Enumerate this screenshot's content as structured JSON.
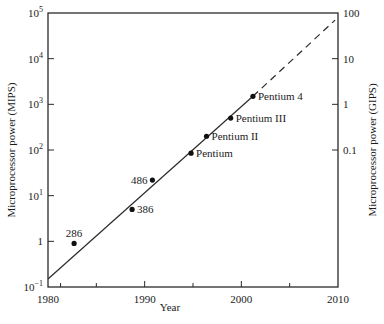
{
  "chart_data": {
    "type": "scatter",
    "title": "",
    "xlabel": "Year",
    "ylabel": "Microprocessor power (MIPS)",
    "ylabel_right": "Microprocessor power (GIPS)",
    "xlim": [
      1980,
      2010
    ],
    "ylim": [
      0.1,
      100000
    ],
    "yscale": "log",
    "grid": false,
    "legend": null,
    "x_ticks": [
      1980,
      1990,
      2000,
      2010
    ],
    "x_tick_labels": [
      "1980",
      "1990",
      "2000",
      "2010"
    ],
    "x_minor_ticks": [
      1981.3,
      1985,
      1995,
      2005
    ],
    "y_ticks": [
      0.1,
      1,
      10,
      100,
      1000,
      10000,
      100000
    ],
    "y_tick_labels": [
      {
        "base": "10",
        "exp": "−1"
      },
      {
        "base": "1",
        "exp": ""
      },
      {
        "base": "10",
        "exp": "1"
      },
      {
        "base": "10",
        "exp": "2"
      },
      {
        "base": "10",
        "exp": "3"
      },
      {
        "base": "10",
        "exp": "4"
      },
      {
        "base": "10",
        "exp": "5"
      }
    ],
    "y_right_ticks_mips": [
      100,
      1000,
      10000,
      100000
    ],
    "y_right_tick_labels": [
      "0.1",
      "1",
      "10",
      "100"
    ],
    "points": [
      {
        "label": "286",
        "x": 1982.7,
        "y": 0.9,
        "label_pos": "above"
      },
      {
        "label": "386",
        "x": 1988.7,
        "y": 5,
        "label_pos": "right"
      },
      {
        "label": "486",
        "x": 1990.8,
        "y": 22,
        "label_pos": "left"
      },
      {
        "label": "Pentium",
        "x": 1994.8,
        "y": 85,
        "label_pos": "right"
      },
      {
        "label": "Pentium II",
        "x": 1996.4,
        "y": 200,
        "label_pos": "right"
      },
      {
        "label": "Pentium III",
        "x": 1998.9,
        "y": 500,
        "label_pos": "right"
      },
      {
        "label": "Pentium 4",
        "x": 2001.2,
        "y": 1500,
        "label_pos": "right"
      }
    ],
    "trend_line": {
      "solid": {
        "x": [
          1980,
          2001.2
        ],
        "y": [
          0.15,
          1500
        ]
      },
      "dashed": {
        "x": [
          2001.2,
          2009.7
        ],
        "y": [
          1500,
          70000
        ]
      }
    }
  }
}
